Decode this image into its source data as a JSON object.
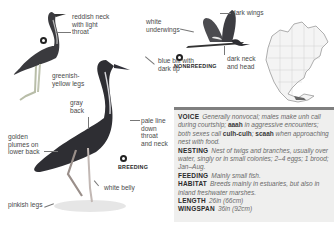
{
  "illustrations": {
    "juvenile_labels": {
      "neck": "reddish neck\nwith light\nthroat",
      "legs": "greenish-\nyellow legs"
    },
    "breeding_labels": {
      "back": "gray\nback",
      "plumes": "golden\nplumes on\nlower back",
      "legs": "pinkish legs",
      "bill": "blue bill with\ndark tip",
      "throat": "pale line\ndown\nthroat\nand neck",
      "belly": "white belly",
      "tag": "BREEDING"
    },
    "flight_labels": {
      "underwings": "white\nunderwings",
      "wings": "dark wings",
      "head": "dark neck\nand head",
      "tag": "NONBREEDING"
    },
    "map": {
      "region": "North America range map"
    }
  },
  "facts": [
    {
      "key": "VOICE",
      "segments": [
        {
          "t": "Generally nonvocal; males make unh call during courtship; ",
          "s": "i"
        },
        {
          "t": "aaah",
          "s": "b"
        },
        {
          "t": " in aggressive encounters; both sexes call ",
          "s": "i"
        },
        {
          "t": "culh-culh",
          "s": "b"
        },
        {
          "t": "; ",
          "s": "i"
        },
        {
          "t": "scaah",
          "s": "b"
        },
        {
          "t": " when approaching nest with food.",
          "s": "i"
        }
      ]
    },
    {
      "key": "NESTING",
      "segments": [
        {
          "t": "Nest of twigs and branches, usually over water, singly or in small colonies; 2–4 eggs; 1 brood; Jan–Aug.",
          "s": "i"
        }
      ]
    },
    {
      "key": "FEEDING",
      "segments": [
        {
          "t": "Mainly small fish.",
          "s": "i"
        }
      ]
    },
    {
      "key": "HABITAT",
      "segments": [
        {
          "t": "Breeds mainly in estuaries, but also in inland freshwater marshes.",
          "s": "i"
        }
      ]
    },
    {
      "key": "LENGTH",
      "segments": [
        {
          "t": "26in (66cm)",
          "s": "i"
        }
      ]
    },
    {
      "key": "WINGSPAN",
      "segments": [
        {
          "t": "36in (92cm)",
          "s": "i"
        }
      ]
    }
  ],
  "colors": {
    "box_bg": "#efefee",
    "box_rule": "#7f7f7f",
    "bird_dark": "#2e2e33"
  }
}
